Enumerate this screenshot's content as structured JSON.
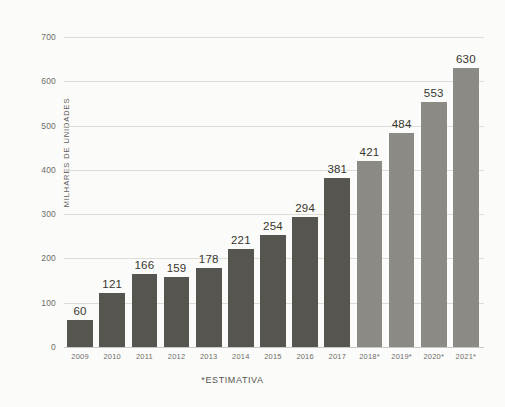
{
  "chart_data": {
    "type": "bar",
    "title": "",
    "xlabel": "",
    "ylabel": "MILHARES DE UNIDADES",
    "categories": [
      "2009",
      "2010",
      "2011",
      "2012",
      "2013",
      "2014",
      "2015",
      "2016",
      "2017",
      "2018*",
      "2019*",
      "2020*",
      "2021*"
    ],
    "values": [
      60,
      121,
      166,
      159,
      178,
      221,
      254,
      294,
      381,
      421,
      484,
      553,
      630
    ],
    "value_labels": [
      "60",
      "121",
      "166",
      "159",
      "178",
      "221",
      "254",
      "294",
      "381",
      "421",
      "484",
      "553",
      "630"
    ],
    "series": [
      {
        "name": "Milhares de unidades",
        "values": [
          60,
          121,
          166,
          159,
          178,
          221,
          254,
          294,
          381,
          421,
          484,
          553,
          630
        ]
      }
    ],
    "estimated_flags": [
      false,
      false,
      false,
      false,
      false,
      false,
      false,
      false,
      false,
      true,
      true,
      true,
      true
    ],
    "ylim": [
      0,
      700
    ],
    "y_ticks": [
      0,
      100,
      200,
      300,
      400,
      500,
      600,
      700
    ],
    "y_tick_labels": [
      "0",
      "100",
      "200",
      "300",
      "400",
      "500",
      "600",
      "700"
    ],
    "grid": true,
    "legend": "none",
    "footnote": "*ESTIMATIVA",
    "colors": {
      "bar_actual": "#56554f",
      "bar_estimate": "#8b8a84",
      "background": "#fbfbf9",
      "gridline": "#dedcd6",
      "value_label": "#38372f",
      "tick_label": "#6e6e69"
    }
  }
}
